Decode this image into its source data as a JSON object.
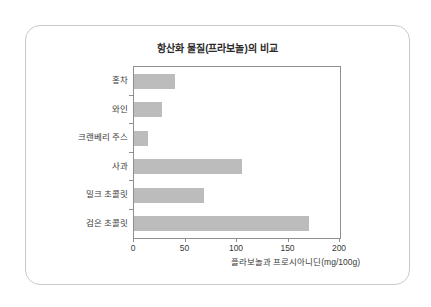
{
  "chart_data": {
    "type": "bar",
    "orientation": "horizontal",
    "title": "항산화 물질(프라보놀)의 비교",
    "categories": [
      "홍차",
      "와인",
      "크랜베리 주스",
      "사과",
      "밀크 초콜릿",
      "검은 초콜릿"
    ],
    "values": [
      40,
      27,
      14,
      105,
      68,
      170
    ],
    "xlabel": "플라보놀과 프로시아니딘(mg/100g)",
    "ylabel": "",
    "xlim": [
      0,
      200
    ],
    "xticks": [
      0,
      50,
      100,
      150,
      200
    ],
    "grid": false,
    "legend": null,
    "bar_color": "#bcbcbc",
    "plot_border_color": "#8f8f8f",
    "card_border_color": "#c9c9c9"
  }
}
